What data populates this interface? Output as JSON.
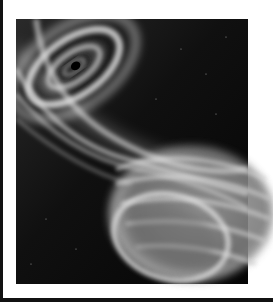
{
  "image": {
    "subject": "abstract space artwork: swirling spiral vortex with glowing grey streams flowing into a banded planet sphere",
    "palette": {
      "background": "#ffffff",
      "space": "#050505",
      "glow": "#d8d8d8",
      "planet": "#8a8a8a",
      "frame": "#111111"
    }
  }
}
